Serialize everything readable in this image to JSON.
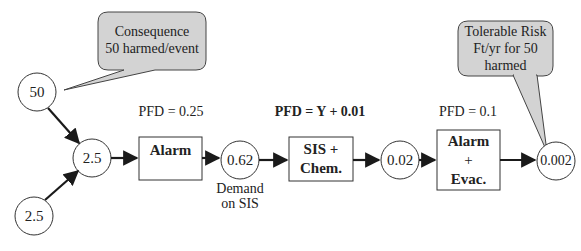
{
  "callouts": {
    "consequence": {
      "line1": "Consequence",
      "line2": "50 harmed/event"
    },
    "tolerable": {
      "line1": "Tolerable Risk",
      "line2": "Ft/yr for 50",
      "line3": "harmed"
    }
  },
  "nodes": {
    "consequence": "50",
    "initiating_top": "2.5",
    "initiating_bottom": "2.5",
    "demand": "0.62",
    "after_sis": "0.02",
    "final": "0.002"
  },
  "node_labels": {
    "demand_line1": "Demand",
    "demand_line2": "on SIS"
  },
  "layers": [
    {
      "name": "Alarm",
      "pfd": "PFD = 0.25"
    },
    {
      "name_line1": "SIS +",
      "name_line2": "Chem.",
      "pfd": "PFD = Y + 0.01"
    },
    {
      "name_line1": "Alarm",
      "name_line2": "+",
      "name_line3": "Evac.",
      "pfd": "PFD = 0.1"
    }
  ],
  "colors": {
    "callout_fill": "#d3d3d3",
    "stroke": "#333333",
    "arrow": "#1a1a1a"
  }
}
